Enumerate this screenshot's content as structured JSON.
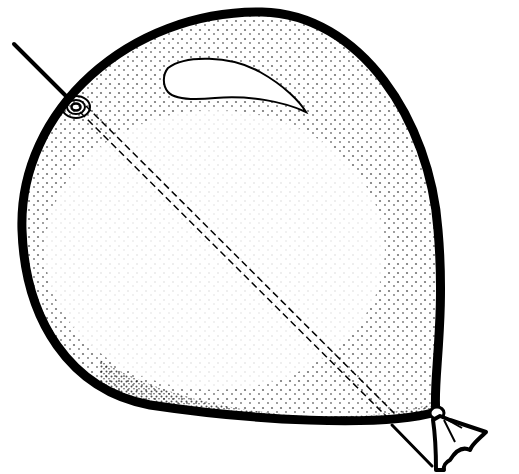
{
  "illustration": {
    "subject": "Balloon pierced by a needle",
    "elements": [
      {
        "name": "balloon",
        "description": "stippled balloon outline with heavy black border"
      },
      {
        "name": "highlight",
        "description": "crescent-shaped unshaded highlight near top"
      },
      {
        "name": "needle",
        "description": "needle entering upper-left, passing diagonally through to lower-right"
      },
      {
        "name": "puncture",
        "description": "concentric swirl at needle entry point"
      },
      {
        "name": "knot",
        "description": "tied balloon neck at lower-right"
      }
    ],
    "colors": {
      "ink": "#000000",
      "paper": "#ffffff"
    }
  }
}
